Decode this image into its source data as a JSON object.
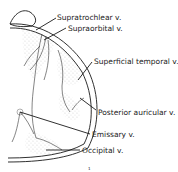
{
  "figure": {
    "labels": [
      {
        "id": "supratrochlear",
        "text": "Supratrochlear v."
      },
      {
        "id": "supraorbital",
        "text": "Supraorbital v."
      },
      {
        "id": "superficial_temporal",
        "text": "Superficial temporal v."
      },
      {
        "id": "posterior_auricular",
        "text": "Posterior auricular v."
      },
      {
        "id": "emissary",
        "text": "Emissary v."
      },
      {
        "id": "occipital",
        "text": "Occipital v."
      }
    ],
    "page_marker": "1"
  }
}
